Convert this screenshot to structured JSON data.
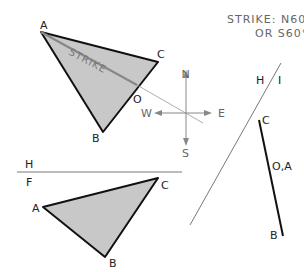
{
  "title": {
    "line1": "STRIKE: N60°W",
    "line2": "OR S60°E"
  },
  "top_view": {
    "labels": {
      "A": "A",
      "B": "B",
      "C": "C",
      "O": "O"
    },
    "strike_label": "STRIKE",
    "fill_color": "#c8c8c8",
    "edge_color": "#111111",
    "strike_line_color": "#888888"
  },
  "compass": {
    "N": "N",
    "S": "S",
    "E": "E",
    "W": "W",
    "color": "#888888"
  },
  "fold_line_HI": {
    "left_label": "H",
    "right_label": "I"
  },
  "edge_view": {
    "labels": {
      "C": "C",
      "OA": "O,A",
      "B": "B"
    }
  },
  "fold_line_HF": {
    "top_label": "H",
    "bottom_label": "F"
  },
  "front_view": {
    "labels": {
      "A": "A",
      "B": "B",
      "C": "C"
    },
    "fill_color": "#c8c8c8",
    "edge_color": "#111111"
  }
}
